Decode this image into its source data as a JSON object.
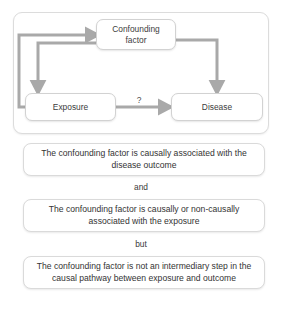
{
  "diagram": {
    "type": "causal-confounding-diagram",
    "nodes": [
      {
        "id": "confounder",
        "label": "Confounding\nfactor"
      },
      {
        "id": "exposure",
        "label": "Exposure"
      },
      {
        "id": "disease",
        "label": "Disease"
      }
    ],
    "node_labels": {
      "confounder_line1": "Confounding",
      "confounder_line2": "factor",
      "exposure": "Exposure",
      "disease": "Disease"
    },
    "edges": [
      {
        "from": "exposure",
        "to": "confounder",
        "label": "",
        "style": "elbow-left-up"
      },
      {
        "from": "confounder",
        "to": "exposure",
        "label": "",
        "style": "elbow-left-down"
      },
      {
        "from": "confounder",
        "to": "disease",
        "label": "",
        "style": "elbow-right-down"
      },
      {
        "from": "exposure",
        "to": "disease",
        "label": "?",
        "style": "straight"
      }
    ],
    "edge_label_question": "?",
    "arrow_color": "#a9a9a9",
    "box_border_color": "#d4d4d4"
  },
  "statements": [
    {
      "id": "stmt-1",
      "text": "The confounding factor is causally associated with the disease outcome"
    },
    {
      "id": "stmt-2",
      "text": "The confounding factor is causally or non-causally associated with the exposure"
    },
    {
      "id": "stmt-3",
      "text": "The confounding factor is not an intermediary step in the causal pathway between exposure and outcome"
    }
  ],
  "connectors": {
    "and": "and",
    "but": "but"
  }
}
